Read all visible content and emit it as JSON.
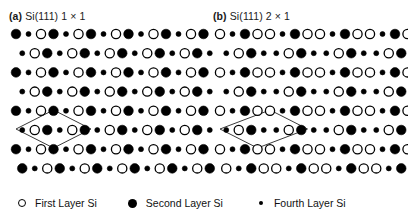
{
  "figure": {
    "panels": [
      {
        "tag": "(a)",
        "title": "Si(111) 1 × 1",
        "cell_label": "1 × 1 unit cell"
      },
      {
        "tag": "(b)",
        "title": "Si(111) 2 × 1",
        "cell_label": "2 × 1 unit cell"
      }
    ],
    "legend": [
      {
        "marker": "open-circle",
        "label": "First Layer Si"
      },
      {
        "marker": "filled-circle-large",
        "label": "Second Layer Si"
      },
      {
        "marker": "filled-circle-small",
        "label": "Fourth Layer Si"
      }
    ],
    "colors": {
      "background": "#ffffff",
      "atom_stroke": "#000000",
      "atom_fill_first_layer": "#ffffff",
      "atom_fill_deep_layer": "#000000",
      "unit_cell_line": "#3a3a3a",
      "text": "#111111"
    }
  },
  "chart_data": {
    "type": "scatter",
    "xlabel": "",
    "ylabel": "",
    "grid": false,
    "legend_position": "bottom",
    "marker_types": {
      "open": {
        "name": "First Layer Si",
        "radius": 4.6,
        "fill": "#ffffff",
        "stroke": "#000000"
      },
      "filled": {
        "name": "Second Layer Si",
        "radius": 4.8,
        "fill": "#000000",
        "stroke": "#000000"
      },
      "small": {
        "name": "Fourth Layer Si",
        "radius": 2.5,
        "fill": "#000000",
        "stroke": "#000000"
      }
    },
    "panels": [
      {
        "name": "a",
        "title": "Si(111) 1 × 1",
        "lattice": {
          "col_spacing": 12.5,
          "row_spacing": 19.2,
          "row_shift": 6.25,
          "origin_x": 12,
          "origin_y": 8,
          "n_rows": 8,
          "n_cols": 16,
          "pattern_period": 3,
          "row_patterns": [
            [
              "filled",
              "small",
              "open"
            ],
            [
              "small",
              "open",
              "filled"
            ],
            [
              "filled",
              "small",
              "open"
            ],
            [
              "small",
              "open",
              "filled"
            ],
            [
              "filled",
              "small",
              "open"
            ],
            [
              "small",
              "open",
              "filled"
            ],
            [
              "filled",
              "small",
              "open"
            ],
            [
              "filled",
              "small",
              "open"
            ]
          ]
        },
        "unit_cell": {
          "shape": "rhombus",
          "vertices": [
            [
              12.0,
              103.0
            ],
            [
              49.5,
              84.0
            ],
            [
              87.0,
              103.0
            ],
            [
              49.5,
              122.0
            ]
          ],
          "center_atom": "open"
        }
      },
      {
        "name": "b",
        "title": "Si(111) 2 × 1",
        "lattice": {
          "col_spacing": 12.5,
          "row_spacing": 19.2,
          "row_shift": 6.25,
          "origin_x": 12,
          "origin_y": 8,
          "n_rows": 8,
          "n_cols": 16,
          "pattern_period": 4,
          "row_patterns": [
            [
              "open",
              "small",
              "filled",
              "open"
            ],
            [
              "small",
              "open",
              "filled",
              "small"
            ],
            [
              "open",
              "small",
              "filled",
              "open"
            ],
            [
              "small",
              "open",
              "filled",
              "small"
            ],
            [
              "open",
              "small",
              "filled",
              "open"
            ],
            [
              "small",
              "open",
              "filled",
              "small"
            ],
            [
              "open",
              "small",
              "filled",
              "open"
            ],
            [
              "open",
              "small",
              "filled",
              "open"
            ]
          ]
        },
        "unit_cell": {
          "shape": "rhombus-elongated",
          "vertices": [
            [
              12.0,
              103.0
            ],
            [
              62.0,
              84.0
            ],
            [
              99.5,
              103.0
            ],
            [
              49.5,
              122.0
            ]
          ],
          "center_atom": "filled"
        }
      }
    ]
  }
}
